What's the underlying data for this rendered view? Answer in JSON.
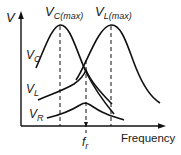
{
  "diagram": {
    "type": "resonance-curves",
    "y_axis_label": "V",
    "x_axis_label": "Frequency",
    "resonant_frequency_label_main": "f",
    "resonant_frequency_label_sub": "r",
    "peak_labels": {
      "vc_max_main": "V",
      "vc_max_sub": "C(max)",
      "vl_max_main": "V",
      "vl_max_sub": "L(max)"
    },
    "curve_labels": {
      "vc_main": "V",
      "vc_sub": "C",
      "vl_main": "V",
      "vl_sub": "L",
      "vr_main": "V",
      "vr_sub": "R"
    },
    "colors": {
      "stroke": "#111111",
      "text": "#1a1a1a",
      "background": "#ffffff"
    }
  }
}
